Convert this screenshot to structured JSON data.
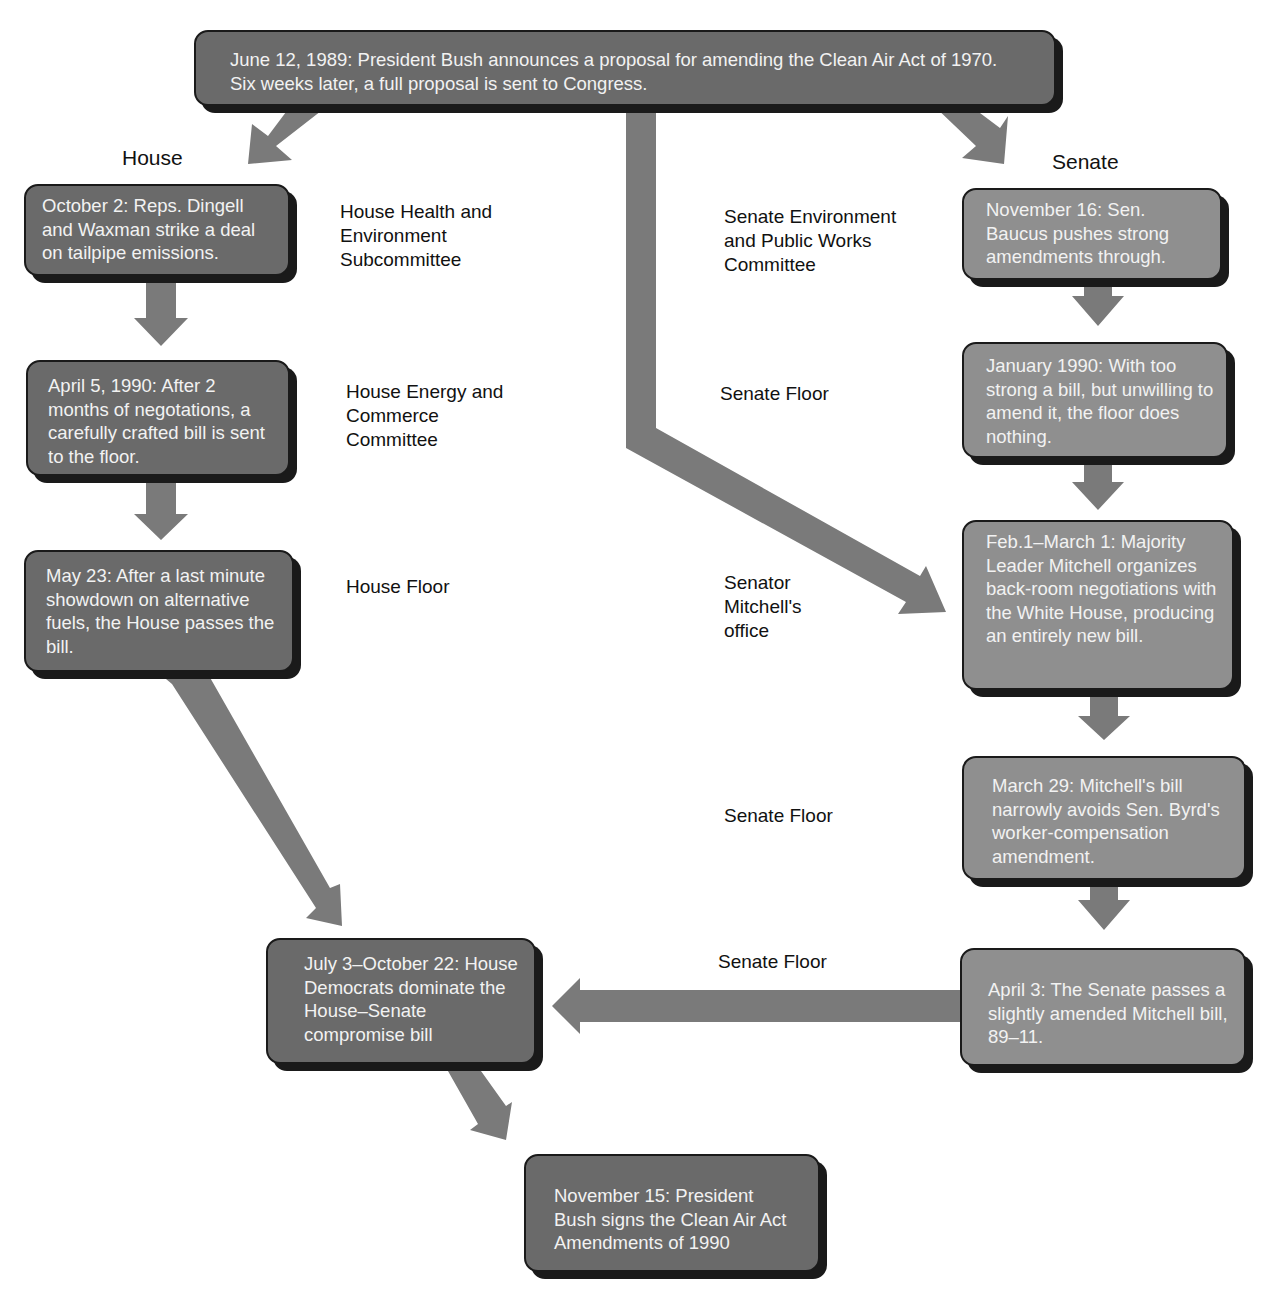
{
  "colors": {
    "house_box": "#6a6a6a",
    "senate_box": "#8f8f8f",
    "arrow": "#7a7a7a",
    "shadow": "#1a1a1a",
    "box_text": "#f2f2f2"
  },
  "start": {
    "text": "June 12, 1989: President Bush announces a proposal for amending the Clean Air Act of 1970. Six weeks later, a full proposal is sent to Congress."
  },
  "headings": {
    "house": "House",
    "senate": "Senate"
  },
  "house": {
    "steps": [
      {
        "text": "October 2: Reps. Dingell and Waxman strike a deal on tailpipe emissions.",
        "venue": "House Health and Environment Subcommittee"
      },
      {
        "text": "April 5, 1990: After 2 months of negotations, a carefully crafted bill is sent to the floor.",
        "venue": "House Energy and Commerce Committee"
      },
      {
        "text": "May 23: After a last minute showdown on alternative fuels, the House passes the bill.",
        "venue": "House Floor"
      }
    ]
  },
  "senate": {
    "steps": [
      {
        "text": "November 16: Sen. Baucus pushes strong amendments through.",
        "venue": "Senate Environment and Public Works Committee"
      },
      {
        "text": "January 1990: With too strong a bill, but unwilling to amend it, the floor does nothing.",
        "venue": "Senate Floor"
      },
      {
        "text": "Feb.1–March 1: Majority Leader Mitchell organizes back-room negotiations with the White House, producing an entirely new bill.",
        "venue": "Senator Mitchell's office"
      },
      {
        "text": "March 29: Mitchell's bill narrowly avoids  Sen. Byrd's worker-compensation amendment.",
        "venue": "Senate Floor"
      },
      {
        "text": "April 3: The Senate passes a slightly amended Mitchell bill, 89–11.",
        "venue": "Senate Floor"
      }
    ]
  },
  "conference": {
    "text": "July 3–October 22: House Democrats dominate the House–Senate compromise bill"
  },
  "final": {
    "text": "November 15: President Bush signs the Clean Air Act Amendments of 1990"
  }
}
